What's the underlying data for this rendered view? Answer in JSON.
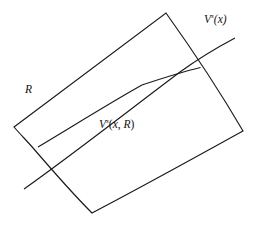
{
  "figure": {
    "name": "stable-manifold-rectangle-diagram",
    "background_color": "#ffffff",
    "stroke_color": "#1a1a1a",
    "stroke_width": 1.1,
    "width": 259,
    "height": 229,
    "labels": {
      "transversal": {
        "base": "V",
        "superscript": "s",
        "argument": "(x)",
        "text": "Vˢ(x)"
      },
      "inner_curve": {
        "base": "V",
        "superscript": "s",
        "argument": "(x, R)",
        "arg_open": "(",
        "arg_x": "x",
        "arg_sep": ", ",
        "arg_r": "R",
        "arg_close": ")",
        "text": "Vˢ(x, R)"
      },
      "region": {
        "text": "R"
      }
    },
    "shapes": {
      "rectangle": {
        "name": "curved-quadrilateral-R",
        "description": "Curvilinear quadrilateral with two nearly straight sides and two curved sides",
        "corners": [
          {
            "name": "left-vertex",
            "x": 14,
            "y": 127
          },
          {
            "name": "top-vertex",
            "x": 166,
            "y": 13
          },
          {
            "name": "right-vertex",
            "x": 243,
            "y": 131
          },
          {
            "name": "bottom-vertex",
            "x": 92,
            "y": 213
          }
        ],
        "path": "M 14 127 L 166 13 L 243 131 L 92 213 Z"
      },
      "inner_curve": {
        "name": "inner-stable-arc",
        "start": {
          "x": 39,
          "y": 148
        },
        "end": {
          "x": 200,
          "y": 68
        },
        "curvature": "bows-downward-right"
      },
      "transversal_line": {
        "name": "transversal-stable-line",
        "start": {
          "x": 24,
          "y": 189
        },
        "end": {
          "x": 235,
          "y": 38
        },
        "curvature": "slight-upward-bow"
      }
    }
  }
}
